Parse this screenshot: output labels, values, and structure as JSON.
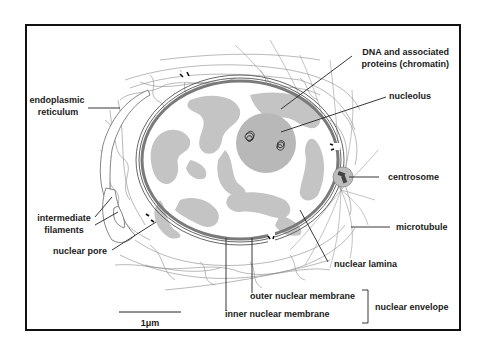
{
  "diagram": {
    "labels": {
      "endoplasmic_reticulum": [
        "endoplasmic",
        "reticulum"
      ],
      "intermediate_filaments": [
        "intermediate",
        "filaments"
      ],
      "nuclear_pore": "nuclear pore",
      "chromatin": [
        "DNA and associated",
        "proteins (chromatin)"
      ],
      "nucleolus": "nucleolus",
      "centrosome": "centrosome",
      "microtubule": "microtubule",
      "nuclear_lamina": "nuclear lamina",
      "outer_nuclear_membrane": "outer nuclear membrane",
      "inner_nuclear_membrane": "inner nuclear membrane",
      "nuclear_envelope": "nuclear envelope"
    },
    "scale_bar": {
      "label": "1μm"
    },
    "colors": {
      "border": "#111111",
      "chromatin": "#c4c4c4",
      "nucleolus": "#b8b8b8",
      "membrane": "#7a7a7a",
      "filament": "#8a8a8a",
      "text": "#1a1a1a"
    }
  }
}
